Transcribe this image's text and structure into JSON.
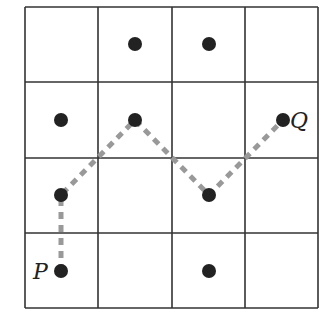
{
  "diagram": {
    "type": "grid-path",
    "grid": {
      "rows": 4,
      "cols": 4,
      "x_lines": [
        25,
        98,
        172,
        245,
        318
      ],
      "y_lines": [
        7,
        82,
        158,
        233,
        308
      ],
      "line_color": "#333333"
    },
    "points": [
      {
        "id": "d1",
        "row": 0,
        "col": 1,
        "cx": 135,
        "cy": 44
      },
      {
        "id": "d2",
        "row": 0,
        "col": 2,
        "cx": 209,
        "cy": 44
      },
      {
        "id": "d3",
        "row": 1,
        "col": 0,
        "cx": 61,
        "cy": 120
      },
      {
        "id": "d4",
        "row": 1,
        "col": 1,
        "cx": 135,
        "cy": 120
      },
      {
        "id": "d5",
        "row": 1,
        "col": 3,
        "cx": 283,
        "cy": 120
      },
      {
        "id": "d6",
        "row": 2,
        "col": 0,
        "cx": 61,
        "cy": 195
      },
      {
        "id": "d7",
        "row": 2,
        "col": 2,
        "cx": 209,
        "cy": 195
      },
      {
        "id": "d8",
        "row": 3,
        "col": 0,
        "cx": 61,
        "cy": 271
      },
      {
        "id": "d9",
        "row": 3,
        "col": 2,
        "cx": 209,
        "cy": 271
      }
    ],
    "point_color": "#222222",
    "path": {
      "style": "dashed",
      "color": "#999999",
      "vertices": [
        [
          61,
          271
        ],
        [
          61,
          195
        ],
        [
          135,
          120
        ],
        [
          209,
          195
        ],
        [
          283,
          120
        ]
      ]
    },
    "labels": {
      "start": {
        "text": "P",
        "x": 33,
        "y": 279
      },
      "end": {
        "text": "Q",
        "x": 290,
        "y": 128
      }
    }
  }
}
